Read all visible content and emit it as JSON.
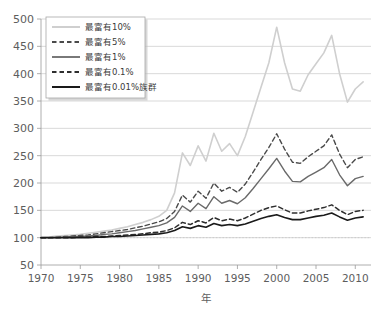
{
  "chart_data": {
    "type": "line",
    "title": "",
    "xlabel": "年",
    "ylabel": "",
    "xlim": [
      1970,
      2012
    ],
    "ylim": [
      50,
      500
    ],
    "grid": true,
    "legend_position": "upper-left",
    "x_ticks": [
      "1970",
      "1975",
      "1980",
      "1985",
      "1990",
      "1995",
      "2000",
      "2005",
      "2010"
    ],
    "y_ticks": [
      "50",
      "100",
      "150",
      "200",
      "250",
      "300",
      "350",
      "400",
      "450",
      "500"
    ],
    "reference_line": 100,
    "x": [
      1970,
      1971,
      1972,
      1973,
      1974,
      1975,
      1976,
      1977,
      1978,
      1979,
      1980,
      1981,
      1982,
      1983,
      1984,
      1985,
      1986,
      1987,
      1988,
      1989,
      1990,
      1991,
      1992,
      1993,
      1994,
      1995,
      1996,
      1997,
      1998,
      1999,
      2000,
      2001,
      2002,
      2003,
      2004,
      2005,
      2006,
      2007,
      2008,
      2009,
      2010,
      2011
    ],
    "series": [
      {
        "name": "最富有10%",
        "color": "#cfcfcf",
        "style": "solid",
        "width": 1.6,
        "values": [
          100,
          101,
          103,
          104,
          105,
          106,
          108,
          110,
          112,
          114,
          117,
          120,
          124,
          128,
          133,
          139,
          150,
          182,
          255,
          232,
          268,
          240,
          291,
          258,
          272,
          250,
          285,
          330,
          375,
          420,
          485,
          420,
          372,
          368,
          398,
          418,
          438,
          470,
          400,
          348,
          372,
          385
        ]
      },
      {
        "name": "最富有5%",
        "color": "#4a4a4a",
        "style": "dashed",
        "width": 1.4,
        "values": [
          100,
          100,
          101,
          102,
          103,
          104,
          105,
          107,
          109,
          111,
          113,
          115,
          118,
          121,
          125,
          129,
          135,
          148,
          178,
          165,
          185,
          172,
          200,
          185,
          192,
          183,
          198,
          220,
          243,
          265,
          290,
          262,
          238,
          236,
          248,
          258,
          268,
          288,
          253,
          228,
          243,
          248
        ]
      },
      {
        "name": "最富有1%",
        "color": "#6a6a6a",
        "style": "solid",
        "width": 1.4,
        "values": [
          100,
          100,
          100,
          101,
          102,
          102,
          103,
          104,
          106,
          107,
          109,
          111,
          113,
          116,
          119,
          122,
          127,
          137,
          158,
          148,
          163,
          153,
          175,
          163,
          168,
          162,
          173,
          190,
          208,
          226,
          245,
          222,
          203,
          202,
          212,
          220,
          228,
          243,
          215,
          195,
          208,
          212
        ]
      },
      {
        "name": "最富有0.1%",
        "color": "#2e2e2e",
        "style": "dashed",
        "width": 1.5,
        "values": [
          100,
          100,
          100,
          100,
          100,
          101,
          101,
          102,
          102,
          103,
          104,
          105,
          106,
          107,
          109,
          110,
          113,
          118,
          128,
          124,
          131,
          127,
          137,
          131,
          134,
          131,
          136,
          143,
          150,
          155,
          158,
          151,
          145,
          145,
          149,
          152,
          155,
          160,
          150,
          142,
          148,
          150
        ]
      },
      {
        "name": "最富有0.01%族群",
        "color": "#1a1a1a",
        "style": "solid",
        "width": 1.6,
        "values": [
          100,
          100,
          100,
          100,
          100,
          100,
          100,
          101,
          101,
          102,
          102,
          103,
          104,
          105,
          106,
          107,
          109,
          113,
          120,
          117,
          122,
          119,
          126,
          122,
          124,
          122,
          125,
          130,
          135,
          139,
          142,
          137,
          133,
          133,
          136,
          139,
          141,
          145,
          138,
          132,
          136,
          138
        ]
      }
    ]
  },
  "legend": {
    "items": [
      {
        "label": "最富有10%"
      },
      {
        "label": "最富有5%"
      },
      {
        "label": "最富有1%"
      },
      {
        "label": "最富有0.1%"
      },
      {
        "label": "最富有0.01%族群"
      }
    ]
  },
  "axes": {
    "x_label": "年",
    "x_ticks": [
      "1970",
      "1975",
      "1980",
      "1985",
      "1990",
      "1995",
      "2000",
      "2005",
      "2010"
    ],
    "y_ticks": [
      "500",
      "450",
      "400",
      "350",
      "300",
      "250",
      "200",
      "150",
      "100",
      "50"
    ]
  }
}
